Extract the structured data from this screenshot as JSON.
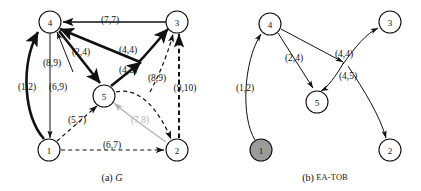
{
  "figure": {
    "panels": [
      {
        "id": "panel-a",
        "caption_prefix": "(a)",
        "caption_text": "G",
        "nodes": [
          {
            "id": "a4",
            "label": "4",
            "cx": 50,
            "cy": 22,
            "r": 11,
            "filled": false
          },
          {
            "id": "a3",
            "label": "3",
            "cx": 177,
            "cy": 22,
            "r": 11,
            "filled": false
          },
          {
            "id": "a5",
            "label": "5",
            "cx": 104,
            "cy": 96,
            "r": 11,
            "filled": false
          },
          {
            "id": "a1",
            "label": "1",
            "cx": 49,
            "cy": 150,
            "r": 11,
            "filled": false
          },
          {
            "id": "a2",
            "label": "2",
            "cx": 177,
            "cy": 150,
            "r": 11,
            "filled": false
          }
        ],
        "edge_labels": [
          {
            "id": "a-l-77",
            "text": "(7,7)",
            "x": 110,
            "y": 20,
            "faded": false
          },
          {
            "id": "a-l-24",
            "text": "(2,4)",
            "x": 81,
            "y": 52,
            "faded": false
          },
          {
            "id": "a-l-44",
            "text": "(4,4)",
            "x": 128,
            "y": 50,
            "faded": false
          },
          {
            "id": "a-l-89t",
            "text": "(8,9)",
            "x": 52,
            "y": 63,
            "faded": false
          },
          {
            "id": "a-l-45",
            "text": "(4,5)",
            "x": 128,
            "y": 70,
            "faded": false
          },
          {
            "id": "a-l-89r",
            "text": "(8,9)",
            "x": 157,
            "y": 78,
            "faded": false
          },
          {
            "id": "a-l-910",
            "text": "(9,10)",
            "x": 185,
            "y": 88,
            "faded": false
          },
          {
            "id": "a-l-12",
            "text": "(1,2)",
            "x": 27,
            "y": 87,
            "faded": false
          },
          {
            "id": "a-l-69",
            "text": "(6,9)",
            "x": 58,
            "y": 87,
            "faded": false
          },
          {
            "id": "a-l-57",
            "text": "(5,7)",
            "x": 77,
            "y": 120,
            "faded": false
          },
          {
            "id": "a-l-78",
            "text": "(7,8)",
            "x": 140,
            "y": 120,
            "faded": true
          },
          {
            "id": "a-l-67",
            "text": "(6,7)",
            "x": 112,
            "y": 145,
            "faded": false
          }
        ]
      },
      {
        "id": "panel-b",
        "caption_prefix": "(b)",
        "caption_text": "EA-TOB",
        "nodes": [
          {
            "id": "b4",
            "label": "4",
            "cx": 270,
            "cy": 24,
            "r": 11,
            "filled": false
          },
          {
            "id": "b3",
            "label": "3",
            "cx": 390,
            "cy": 22,
            "r": 11,
            "filled": false
          },
          {
            "id": "b5",
            "label": "5",
            "cx": 317,
            "cy": 102,
            "r": 11,
            "filled": false
          },
          {
            "id": "b1",
            "label": "1",
            "cx": 261,
            "cy": 150,
            "r": 11,
            "filled": true
          },
          {
            "id": "b2",
            "label": "2",
            "cx": 390,
            "cy": 150,
            "r": 11,
            "filled": false
          }
        ],
        "edge_labels": [
          {
            "id": "b-l-24",
            "text": "(2,4)",
            "x": 294,
            "y": 58,
            "faded": false
          },
          {
            "id": "b-l-44",
            "text": "(4,4)",
            "x": 344,
            "y": 54,
            "faded": false
          },
          {
            "id": "b-l-45",
            "text": "(4,5)",
            "x": 348,
            "y": 76,
            "faded": false
          },
          {
            "id": "b-l-12",
            "text": "(1,2)",
            "x": 245,
            "y": 88,
            "faded": false
          }
        ]
      }
    ],
    "colors": {
      "stroke": "#111111",
      "faded": "#b3b3b3",
      "node_fill": "#ffffff",
      "node_fill_highlight": "#9b9b9b",
      "background": "#ffffff"
    }
  }
}
